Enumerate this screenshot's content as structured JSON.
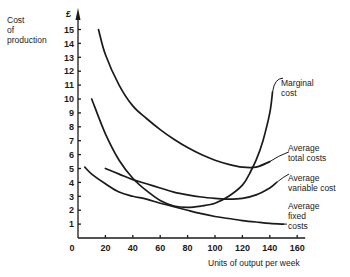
{
  "chart_data": {
    "type": "line",
    "title": "",
    "xlabel": "Units of output per week",
    "ylabel": "Cost of production",
    "y_unit": "£",
    "xlim": [
      0,
      160
    ],
    "ylim": [
      0,
      15
    ],
    "grid": false,
    "legend_position": "inline labels at curve ends (right)",
    "x_ticks": [
      0,
      20,
      40,
      60,
      80,
      100,
      120,
      140,
      160
    ],
    "y_ticks": [
      1,
      2,
      3,
      4,
      5,
      6,
      7,
      8,
      9,
      10,
      11,
      12,
      13,
      14,
      15
    ],
    "series": [
      {
        "name": "Marginal cost",
        "x": [
          10,
          20,
          30,
          40,
          50,
          60,
          70,
          80,
          90,
          100,
          110,
          120,
          125,
          130,
          135,
          140,
          142
        ],
        "values": [
          10,
          7.5,
          5.6,
          4.3,
          3.4,
          2.7,
          2.3,
          2.2,
          2.3,
          2.5,
          3.0,
          3.8,
          4.6,
          5.6,
          7.0,
          9.0,
          10.5
        ]
      },
      {
        "name": "Average total costs",
        "x": [
          15,
          20,
          30,
          40,
          50,
          60,
          70,
          80,
          90,
          100,
          110,
          120,
          130,
          140
        ],
        "values": [
          15,
          13.2,
          11.0,
          9.5,
          8.6,
          7.8,
          7.1,
          6.5,
          6.0,
          5.6,
          5.3,
          5.1,
          5.1,
          5.5
        ]
      },
      {
        "name": "Average variable cost",
        "x": [
          20,
          30,
          40,
          50,
          60,
          70,
          80,
          90,
          100,
          110,
          120,
          130,
          140,
          145
        ],
        "values": [
          5.0,
          4.6,
          4.2,
          3.9,
          3.6,
          3.3,
          3.1,
          2.95,
          2.85,
          2.8,
          2.85,
          3.1,
          3.6,
          4.0
        ]
      },
      {
        "name": "Average fixed costs",
        "x": [
          5,
          10,
          20,
          30,
          40,
          50,
          60,
          70,
          80,
          90,
          100,
          110,
          120,
          130,
          140,
          150
        ],
        "values": [
          5.1,
          4.6,
          3.9,
          3.3,
          3.0,
          2.8,
          2.5,
          2.25,
          2.0,
          1.75,
          1.55,
          1.4,
          1.25,
          1.15,
          1.05,
          1.0
        ]
      }
    ]
  },
  "labels": {
    "y_axis_line1": "Cost",
    "y_axis_line2": "of",
    "y_axis_line3": "production",
    "currency": "£",
    "x_axis": "Units of output per week",
    "mc_line1": "Marginal",
    "mc_line2": "cost",
    "atc_line1": "Average",
    "atc_line2": "total costs",
    "avc_line1": "Average",
    "avc_line2": "variable cost",
    "afc_line1": "Average",
    "afc_line2": "fixed",
    "afc_line3": "costs"
  }
}
